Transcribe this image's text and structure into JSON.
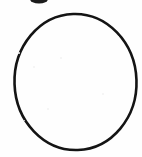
{
  "document": {
    "kind": "scanned-figure",
    "background_color": "#fefefe",
    "ink_color": "#1a1a1a",
    "width_px": 142,
    "height_px": 157,
    "alt_text": "Hand-drawn black circle outline on white paper with a small ink blob clipped at the top edge"
  },
  "figure": {
    "name": "circle-outline",
    "shape": "ellipse",
    "center_x": 75.5,
    "center_y": 82,
    "radius_x": 61,
    "radius_y": 68,
    "stroke_color": "#141414",
    "stroke_width": 2.6,
    "fill": "none",
    "rotation_deg": -2
  },
  "artifacts": [
    {
      "name": "ink-blob-top",
      "shape": "ellipse",
      "center_x": 39,
      "center_y": -1,
      "radius_x": 9,
      "radius_y": 4.5,
      "color": "#1c1c1c",
      "clipped_edge": "top"
    }
  ],
  "specks": [
    {
      "x": 18,
      "y": 52,
      "size": 2
    },
    {
      "x": 33,
      "y": 66,
      "size": 2
    },
    {
      "x": 60,
      "y": 57,
      "size": 2
    },
    {
      "x": 102,
      "y": 93,
      "size": 2
    },
    {
      "x": 47,
      "y": 108,
      "size": 2
    },
    {
      "x": 24,
      "y": 120,
      "size": 1
    },
    {
      "x": 118,
      "y": 36,
      "size": 1
    },
    {
      "x": 88,
      "y": 140,
      "size": 1
    }
  ],
  "labels": {
    "figure_caption": ""
  }
}
